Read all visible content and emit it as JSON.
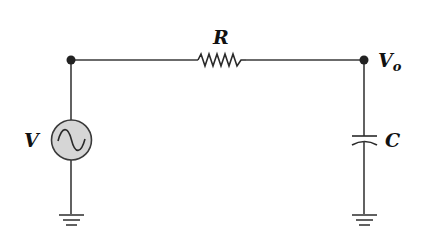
{
  "diagram": {
    "type": "RC low-pass circuit",
    "components": {
      "source": {
        "label": "V",
        "kind": "AC voltage source",
        "symbol": "sine-wave-in-circle"
      },
      "resistor": {
        "label": "R",
        "kind": "resistor"
      },
      "capacitor": {
        "label": "C",
        "kind": "capacitor"
      },
      "output": {
        "label": "V",
        "subscript": "o",
        "kind": "output node"
      }
    },
    "grounds": 2,
    "nodes": 2,
    "colors": {
      "wire": "#3a3a3a",
      "node": "#222222",
      "source_fill": "#d6d6d6",
      "label": "#111111"
    }
  }
}
